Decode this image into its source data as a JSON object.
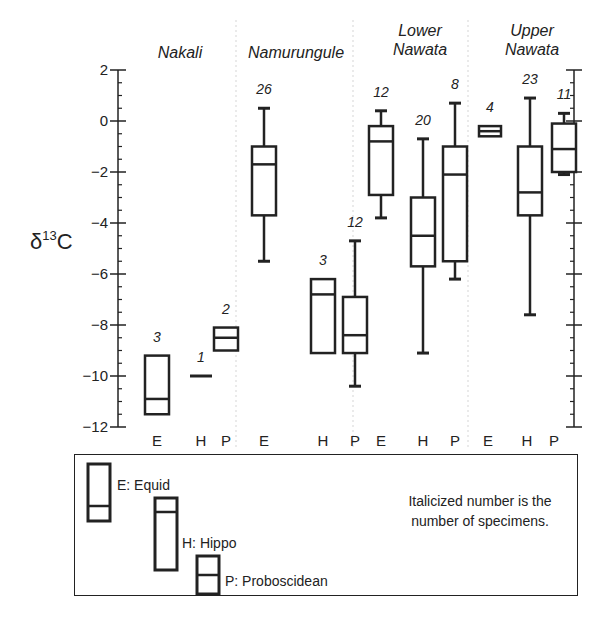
{
  "chart_data": {
    "type": "boxplot",
    "title": "",
    "ylabel": "δ13C",
    "ylabel_parts": {
      "prefix": "δ",
      "sup": "13",
      "suffix": "C"
    },
    "ylim": [
      -12,
      2
    ],
    "yticks": [
      2,
      0,
      -2,
      -4,
      -6,
      -8,
      -10,
      -12
    ],
    "ytick_labels": [
      "2",
      "0",
      "−2",
      "−4",
      "−6",
      "−8",
      "−10",
      "−12"
    ],
    "minor_tick_step": 0.5,
    "categories_per_group": [
      "E",
      "H",
      "P"
    ],
    "groups": [
      {
        "name": "Nakali",
        "name_lines": [
          "Nakali"
        ],
        "boxes": [
          {
            "category": "E",
            "n": 3,
            "whisker_high": null,
            "q3": -9.2,
            "median": -10.9,
            "q1": -11.5,
            "whisker_low": null
          },
          {
            "category": "H",
            "n": 1,
            "single": -10.0
          },
          {
            "category": "P",
            "n": 2,
            "whisker_high": null,
            "q3": -8.1,
            "median": -8.5,
            "q1": -9.0,
            "whisker_low": null
          }
        ]
      },
      {
        "name": "Namurungule",
        "name_lines": [
          "Namurungule"
        ],
        "boxes": [
          {
            "category": "E",
            "n": 26,
            "whisker_high": 0.5,
            "q3": -1.0,
            "median": -1.7,
            "q1": -3.7,
            "whisker_low": -5.5
          },
          {
            "category": "H",
            "n": 3,
            "whisker_high": null,
            "q3": -6.2,
            "median": -6.8,
            "q1": -9.1,
            "whisker_low": null
          },
          {
            "category": "P",
            "n": 12,
            "whisker_high": -4.7,
            "q3": -6.9,
            "median": -8.4,
            "q1": -9.1,
            "whisker_low": -10.4
          }
        ]
      },
      {
        "name": "Lower Nawata",
        "name_lines": [
          "Lower",
          "Nawata"
        ],
        "boxes": [
          {
            "category": "E",
            "n": 12,
            "whisker_high": 0.4,
            "q3": -0.2,
            "median": -0.8,
            "q1": -2.9,
            "whisker_low": -3.8
          },
          {
            "category": "H",
            "n": 20,
            "whisker_high": -0.7,
            "q3": -3.0,
            "median": -4.5,
            "q1": -5.7,
            "whisker_low": -9.1
          },
          {
            "category": "P",
            "n": 8,
            "whisker_high": 0.7,
            "q3": -1.0,
            "median": -2.1,
            "q1": -5.5,
            "whisker_low": -6.2
          }
        ]
      },
      {
        "name": "Upper Nawata",
        "name_lines": [
          "Upper",
          "Nawata"
        ],
        "boxes": [
          {
            "category": "E",
            "n": 4,
            "whisker_high": null,
            "q3": -0.2,
            "median": -0.4,
            "q1": -0.6,
            "whisker_low": null
          },
          {
            "category": "H",
            "n": 23,
            "whisker_high": 0.9,
            "q3": -1.0,
            "median": -2.8,
            "q1": -3.7,
            "whisker_low": -7.6
          },
          {
            "category": "P",
            "n": 11,
            "whisker_high": 0.3,
            "q3": -0.1,
            "median": -1.1,
            "q1": -2.0,
            "whisker_low": -2.1
          }
        ]
      }
    ],
    "grid": false,
    "group_dividers": "light dotted vertical lines",
    "legend_position": "bottom"
  },
  "legend": {
    "entries": [
      {
        "key": "E",
        "label": "E:  Equid"
      },
      {
        "key": "H",
        "label": "H:  Hippo"
      },
      {
        "key": "P",
        "label": "P:  Proboscidean"
      }
    ],
    "note_line1": "Italicized number is the",
    "note_line2": "number of specimens."
  },
  "colors": {
    "ink": "#222222",
    "divider": "#dddddd",
    "background": "#ffffff"
  }
}
